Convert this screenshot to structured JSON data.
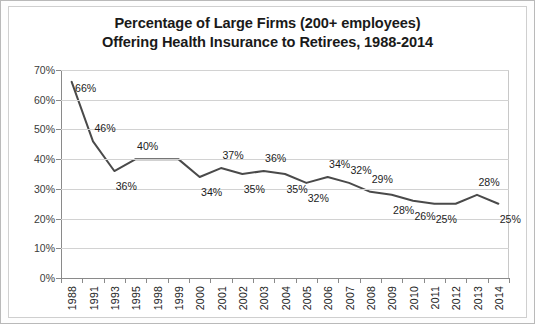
{
  "chart_data": {
    "type": "line",
    "title": "Percentage of Large Firms (200+ employees) Offering Health Insurance to Retirees, 1988-2014",
    "title_lines": [
      "Percentage of Large Firms (200+ employees)",
      "Offering Health Insurance to Retirees, 1988-2014"
    ],
    "categories": [
      "1988",
      "1991",
      "1993",
      "1995",
      "1998",
      "1999",
      "2000",
      "2001",
      "2002",
      "2003",
      "2004",
      "2005",
      "2006",
      "2007",
      "2008",
      "2009",
      "2010",
      "2011",
      "2012",
      "2013",
      "2014"
    ],
    "values": [
      66,
      46,
      36,
      40,
      40,
      40,
      34,
      37,
      35,
      36,
      35,
      32,
      34,
      32,
      29,
      28,
      26,
      25,
      25,
      28,
      25
    ],
    "point_labels": [
      "66%",
      "46%",
      "36%",
      "40%",
      "40%",
      "40%",
      "34%",
      "37%",
      "35%",
      "36%",
      "35%",
      "32%",
      "34%",
      "32%",
      "29%",
      "28%",
      "26%",
      "25%",
      "25%",
      "28%",
      "25%"
    ],
    "label_positions": [
      "above",
      "above",
      "below",
      "above",
      "",
      "",
      "below",
      "above",
      "below",
      "above",
      "below",
      "below",
      "above",
      "above",
      "above",
      "below",
      "below",
      "below",
      "",
      "above",
      "below"
    ],
    "xlabel": "",
    "ylabel": "",
    "ylim": [
      0,
      70
    ],
    "ytick_values": [
      0,
      10,
      20,
      30,
      40,
      50,
      60,
      70
    ],
    "ytick_labels": [
      "0%",
      "10%",
      "20%",
      "30%",
      "40%",
      "50%",
      "60%",
      "70%"
    ],
    "grid": true,
    "legend": false,
    "series_color": "#4a4a4a",
    "grid_color": "#d2d2d2",
    "axis_color": "#8a8a8a",
    "background_color": "#ffffff"
  }
}
